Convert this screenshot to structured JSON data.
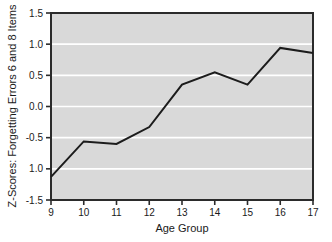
{
  "chart_data": {
    "type": "line",
    "title": "",
    "xlabel": "Age Group",
    "ylabel": "Z-Scores: Forgetting Errors 6 and 8 Items",
    "x": [
      9,
      10,
      11,
      12,
      13,
      14,
      15,
      16,
      17
    ],
    "xtick_labels": [
      "9",
      "10",
      "11",
      "12",
      "13",
      "14",
      "15",
      "16",
      "17"
    ],
    "ytick_labels": [
      "1.5",
      "1.0",
      "0.5",
      "0.0",
      "-0.5",
      "1.0",
      "-1.5"
    ],
    "ytick_values": [
      1.5,
      1.0,
      0.5,
      0.0,
      -0.5,
      -1.0,
      -1.5
    ],
    "values": [
      -1.13,
      -0.56,
      -0.6,
      -0.33,
      0.35,
      0.55,
      0.35,
      0.94,
      0.86
    ],
    "series": [
      {
        "name": "Z-Scores: Forgetting Errors 6 and 8 Items",
        "values": [
          -1.13,
          -0.56,
          -0.6,
          -0.33,
          0.35,
          0.55,
          0.35,
          0.94,
          0.86
        ]
      }
    ],
    "xlim": [
      9,
      17
    ],
    "ylim": [
      -1.5,
      1.5
    ],
    "grid": true,
    "legend": "none",
    "line_color": "#1c1c1c",
    "plot_background_color": "#d9d9d9",
    "gridline_color": "#ffffff",
    "axis_color": "#2b2b2b",
    "figure_background_color": "#ffffff"
  }
}
